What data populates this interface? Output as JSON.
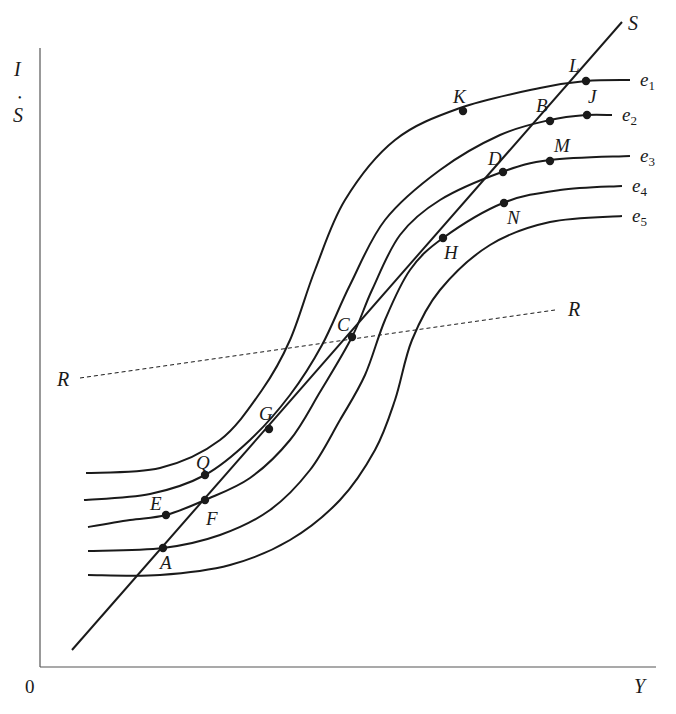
{
  "figure": {
    "colors": {
      "ink": "#1a1a1a",
      "axis": "#555555",
      "background": "#ffffff"
    }
  },
  "axes": {
    "origin_label": "0",
    "x_label": "Y",
    "y_label_top": "I",
    "y_label_dot": "•",
    "y_label_bottom": "S"
  },
  "chart_data": {
    "type": "diagram",
    "title": "",
    "xlabel": "Y",
    "ylabel": "I · S",
    "curves": [
      {
        "name": "e1",
        "label": "e",
        "sub": "1",
        "points": [
          [
            86,
            473
          ],
          [
            160,
            468
          ],
          [
            220,
            440
          ],
          [
            262,
            390
          ],
          [
            290,
            340
          ],
          [
            315,
            270
          ],
          [
            345,
            200
          ],
          [
            395,
            140
          ],
          [
            460,
            108
          ],
          [
            540,
            88
          ],
          [
            586,
            81
          ],
          [
            630,
            80
          ]
        ]
      },
      {
        "name": "e2",
        "label": "e",
        "sub": "2",
        "points": [
          [
            84,
            500
          ],
          [
            150,
            494
          ],
          [
            205,
            475
          ],
          [
            250,
            440
          ],
          [
            290,
            395
          ],
          [
            322,
            345
          ],
          [
            350,
            285
          ],
          [
            385,
            220
          ],
          [
            440,
            170
          ],
          [
            500,
            135
          ],
          [
            550,
            120
          ],
          [
            586,
            115
          ],
          [
            612,
            115
          ]
        ]
      },
      {
        "name": "e3",
        "label": "e",
        "sub": "3",
        "points": [
          [
            88,
            527
          ],
          [
            130,
            520
          ],
          [
            166,
            515
          ],
          [
            205,
            500
          ],
          [
            250,
            478
          ],
          [
            290,
            440
          ],
          [
            320,
            392
          ],
          [
            352,
            337
          ],
          [
            372,
            290
          ],
          [
            400,
            235
          ],
          [
            440,
            200
          ],
          [
            502,
            172
          ],
          [
            550,
            160
          ],
          [
            630,
            156
          ]
        ]
      },
      {
        "name": "e4",
        "label": "e",
        "sub": "4",
        "points": [
          [
            88,
            551
          ],
          [
            163,
            548
          ],
          [
            220,
            535
          ],
          [
            270,
            510
          ],
          [
            310,
            470
          ],
          [
            340,
            420
          ],
          [
            365,
            375
          ],
          [
            385,
            320
          ],
          [
            410,
            270
          ],
          [
            443,
            238
          ],
          [
            503,
            203
          ],
          [
            560,
            190
          ],
          [
            622,
            186
          ]
        ]
      },
      {
        "name": "e5",
        "label": "e",
        "sub": "5",
        "points": [
          [
            88,
            575
          ],
          [
            160,
            575
          ],
          [
            230,
            565
          ],
          [
            290,
            540
          ],
          [
            340,
            500
          ],
          [
            375,
            450
          ],
          [
            395,
            400
          ],
          [
            412,
            340
          ],
          [
            440,
            290
          ],
          [
            490,
            245
          ],
          [
            550,
            222
          ],
          [
            622,
            216
          ]
        ]
      }
    ],
    "lines": [
      {
        "name": "S",
        "label": "S",
        "from": [
          72,
          650
        ],
        "to": [
          622,
          22
        ],
        "style": "solid"
      },
      {
        "name": "R",
        "label": "R",
        "from": [
          80,
          378
        ],
        "to": [
          555,
          310
        ],
        "style": "dashed"
      }
    ],
    "points": [
      {
        "name": "L",
        "x": 586,
        "y": 81,
        "lx": 569,
        "ly": 72
      },
      {
        "name": "K",
        "x": 463,
        "y": 111,
        "lx": 453,
        "ly": 103
      },
      {
        "name": "B",
        "x": 550,
        "y": 121,
        "lx": 536,
        "ly": 112
      },
      {
        "name": "J",
        "x": 587,
        "y": 115,
        "lx": 588,
        "ly": 103
      },
      {
        "name": "D",
        "x": 503,
        "y": 172,
        "lx": 488,
        "ly": 165
      },
      {
        "name": "M",
        "x": 550,
        "y": 161,
        "lx": 554,
        "ly": 152
      },
      {
        "name": "N",
        "x": 504,
        "y": 203,
        "lx": 507,
        "ly": 224
      },
      {
        "name": "H",
        "x": 443,
        "y": 238,
        "lx": 444,
        "ly": 259
      },
      {
        "name": "C",
        "x": 352,
        "y": 337,
        "lx": 337,
        "ly": 331
      },
      {
        "name": "G",
        "x": 269,
        "y": 429,
        "lx": 259,
        "ly": 420
      },
      {
        "name": "Q",
        "x": 205,
        "y": 475,
        "lx": 196,
        "ly": 469
      },
      {
        "name": "E",
        "x": 166,
        "y": 515,
        "lx": 150,
        "ly": 510
      },
      {
        "name": "F",
        "x": 205,
        "y": 500,
        "lx": 206,
        "ly": 525
      },
      {
        "name": "A",
        "x": 163,
        "y": 548,
        "lx": 160,
        "ly": 569
      }
    ],
    "line_labels": [
      {
        "name": "S",
        "x": 628,
        "y": 30
      },
      {
        "name": "R",
        "x": 568,
        "y": 316
      },
      {
        "name": "R",
        "x": 57,
        "y": 386
      }
    ]
  }
}
